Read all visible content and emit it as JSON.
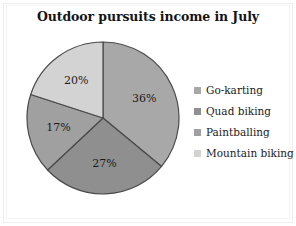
{
  "chart_data": {
    "type": "pie",
    "title": "Outdoor pursuits income in July",
    "categories": [
      "Go-karting",
      "Quad biking",
      "Paintballing",
      "Mountain biking"
    ],
    "values": [
      36,
      27,
      17,
      20
    ],
    "value_labels": [
      "36%",
      "27%",
      "17%",
      "20%"
    ],
    "unit": "%",
    "legend_position": "right",
    "grid": false,
    "colors": [
      "#a8a8a8",
      "#8f8f8f",
      "#a0a0a0",
      "#d3d3d3"
    ],
    "slices": [
      {
        "label": "Go-karting",
        "value": 36,
        "value_label": "36%",
        "color": "#a8a8a8",
        "start_angle": 0,
        "end_angle": 129.6
      },
      {
        "label": "Quad biking",
        "value": 27,
        "value_label": "27%",
        "color": "#8f8f8f",
        "start_angle": 129.6,
        "end_angle": 226.8
      },
      {
        "label": "Paintballing",
        "value": 17,
        "value_label": "17%",
        "color": "#a0a0a0",
        "start_angle": 226.8,
        "end_angle": 288.0
      },
      {
        "label": "Mountain biking",
        "value": 20,
        "value_label": "20%",
        "color": "#d3d3d3",
        "start_angle": 288.0,
        "end_angle": 360.0
      }
    ],
    "stroke_color": "#4a4a4a",
    "background": "#ffffff"
  },
  "legend": {
    "items": [
      {
        "label": "Go-karting",
        "color": "#a8a8a8"
      },
      {
        "label": "Quad biking",
        "color": "#8f8f8f"
      },
      {
        "label": "Paintballing",
        "color": "#a0a0a0"
      },
      {
        "label": "Mountain biking",
        "color": "#d3d3d3"
      }
    ]
  }
}
